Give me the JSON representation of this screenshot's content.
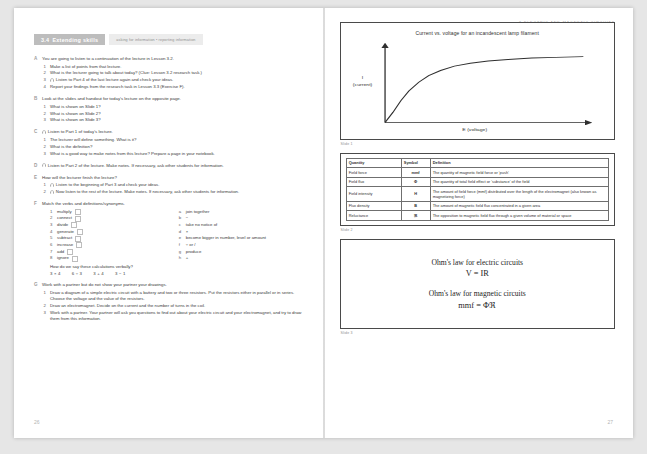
{
  "running_head": "3 ELECTRIC AND MAGNETIC CIRCUITS",
  "folio_left": "26",
  "folio_right": "27",
  "unit": {
    "number": "3.4",
    "title": "Extending skills",
    "skills_tag": "asking for information • reporting information"
  },
  "exercises": [
    {
      "letter": "A",
      "stem": "You are going to listen to a continuation of the lecture in Lesson 3.2.",
      "steps": [
        {
          "text": "Make a list of points from that lecture.",
          "headphone": false
        },
        {
          "text": "What is the lecturer going to talk about today? (Clue: Lesson 3.2 research task.)",
          "headphone": false
        },
        {
          "text": "Listen to Part 4 of the last lecture again and check your ideas.",
          "headphone": true
        },
        {
          "text": "Report your findings from the research task in Lesson 3.3 (Exercise F).",
          "headphone": false
        }
      ]
    },
    {
      "letter": "B",
      "stem": "Look at the slides and handout for today's lecture on the opposite page.",
      "steps": [
        {
          "text": "What is shown on Slide 1?",
          "headphone": false
        },
        {
          "text": "What is shown on Slide 2?",
          "headphone": false
        },
        {
          "text": "What is shown on Slide 3?",
          "headphone": false
        }
      ]
    },
    {
      "letter": "C",
      "stem": "Listen to Part 1 of today's lecture.",
      "stem_headphone": true,
      "steps": [
        {
          "text": "The lecturer will define something. What is it?",
          "headphone": false
        },
        {
          "text": "What is the definition?",
          "headphone": false
        },
        {
          "text": "What is a good way to make notes from this lecture? Prepare a page in your notebook.",
          "headphone": false
        }
      ]
    },
    {
      "letter": "D",
      "stem": "Listen to Part 2 of the lecture. Make notes. If necessary, ask other students for information.",
      "stem_headphone": true,
      "steps": []
    },
    {
      "letter": "E",
      "stem": "How will the lecturer finish the lecture?",
      "steps": [
        {
          "text": "Listen to the beginning of Part 3 and check your ideas.",
          "headphone": true
        },
        {
          "text": "Now listen to the rest of the lecture. Make notes. If necessary, ask other students for information.",
          "headphone": true
        }
      ]
    },
    {
      "letter": "F",
      "stem": "Match the verbs and definitions/synonyms.",
      "steps": [],
      "match": {
        "left": [
          {
            "n": "1",
            "word": "multiply"
          },
          {
            "n": "2",
            "word": "connect"
          },
          {
            "n": "3",
            "word": "divide"
          },
          {
            "n": "4",
            "word": "generate"
          },
          {
            "n": "5",
            "word": "subtract"
          },
          {
            "n": "6",
            "word": "increase"
          },
          {
            "n": "7",
            "word": "add"
          },
          {
            "n": "8",
            "word": "ignore"
          }
        ],
        "right": [
          {
            "k": "a",
            "text": "join together"
          },
          {
            "k": "b",
            "text": "−"
          },
          {
            "k": "c",
            "text": "take no notice of"
          },
          {
            "k": "d",
            "text": "×"
          },
          {
            "k": "e",
            "text": "become bigger in number, level or amount"
          },
          {
            "k": "f",
            "text": "÷ or /"
          },
          {
            "k": "g",
            "text": "produce"
          },
          {
            "k": "h",
            "text": "+"
          }
        ],
        "verbal_question": "How do we say these calculations verbally?",
        "calculations": [
          "3 × 4",
          "6 ÷ 3",
          "3 + 4",
          "3 − 1"
        ]
      }
    },
    {
      "letter": "G",
      "stem": "Work with a partner but do not show your partner your drawings.",
      "steps": [
        {
          "text": "Draw a diagram of a simple electric circuit with a battery and two or three resistors. Put the resistors either in parallel or in series. Choose the voltage and the value of the resistors.",
          "headphone": false
        },
        {
          "text": "Draw an electromagnet. Decide on the current and the number of turns in the coil.",
          "headphone": false
        },
        {
          "text": "Work with a partner. Your partner will ask you questions to find out about your electric circuit and your electromagnet, and try to draw them from this information.",
          "headphone": false
        }
      ]
    }
  ],
  "slides": [
    {
      "caption": "Slide 1"
    },
    {
      "caption": "Slide 2"
    },
    {
      "caption": "Slide 3"
    }
  ],
  "chart_data": {
    "type": "line",
    "title": "Current vs. voltage for an incandescent lamp filament",
    "xlabel": "E (voltage)",
    "ylabel": "I (current)",
    "ylabel_lines": [
      "I",
      "(current)"
    ],
    "grid": false,
    "legend": false,
    "axis_ticks": false,
    "xlim": [
      0,
      100
    ],
    "ylim": [
      0,
      100
    ],
    "x": [
      0,
      4,
      8,
      12,
      17,
      22,
      28,
      35,
      43,
      52,
      62,
      74,
      86,
      100
    ],
    "y": [
      0,
      14,
      30,
      43,
      55,
      64,
      71,
      77,
      81,
      84,
      86,
      88,
      89,
      90
    ]
  },
  "quantities_table": {
    "headers": [
      "Quantity",
      "Symbol",
      "Definition"
    ],
    "rows": [
      {
        "quantity": "Field force",
        "symbol": "mmf",
        "definition": "The quantity of magnetic field force or 'push'"
      },
      {
        "quantity": "Field flux",
        "symbol": "Φ",
        "definition": "The quantity of total field effect or 'substance' of the field"
      },
      {
        "quantity": "Field intensity",
        "symbol": "H",
        "definition": "The amount of field force (mmf) distributed over the length of the electromagnet (also known as magnetizing force)"
      },
      {
        "quantity": "Flux density",
        "symbol": "B",
        "definition": "The amount of magnetic field flux concentrated in a given area"
      },
      {
        "quantity": "Reluctance",
        "symbol": "ℜ",
        "definition": "The opposition to magnetic field flux through a given volume of material or space"
      }
    ]
  },
  "ohms_law": {
    "electric_label": "Ohm's law for electric circuits",
    "electric_equation": "V = IR",
    "magnetic_label": "Ohm's law for magnetic circuits",
    "magnetic_equation": "mmf = Φℜ"
  },
  "colors": {
    "tab_grey": "#bdbdbd",
    "tag_grey": "#ececec",
    "rule": "#4a4a4a",
    "text": "#2b2b2b"
  }
}
